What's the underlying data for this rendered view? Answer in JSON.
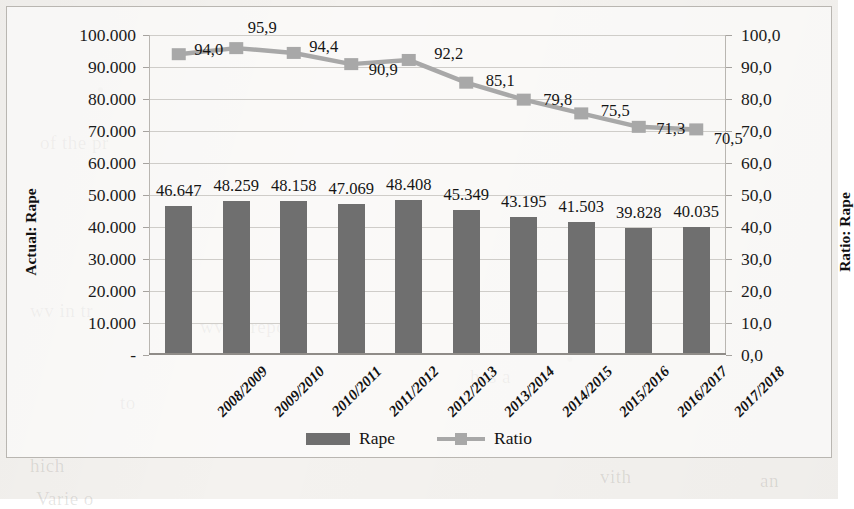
{
  "chart_data": {
    "type": "bar",
    "title": "",
    "categories": [
      "2008/2009",
      "2009/2010",
      "2010/2011",
      "2011/2012",
      "2012/2013",
      "2013/2014",
      "2014/2015",
      "2015/2016",
      "2016/2017",
      "2017/2018"
    ],
    "series": [
      {
        "name": "Rape",
        "type": "bar",
        "axis": "left",
        "values": [
          46647,
          48259,
          48158,
          47069,
          48408,
          45349,
          43195,
          41503,
          39828,
          40035
        ],
        "labels": [
          "46.647",
          "48.259",
          "48.158",
          "47.069",
          "48.408",
          "45.349",
          "43.195",
          "41.503",
          "39.828",
          "40.035"
        ],
        "color": "#6f6f6f"
      },
      {
        "name": "Ratio",
        "type": "line",
        "axis": "right",
        "values": [
          94.0,
          95.9,
          94.4,
          90.9,
          92.2,
          85.1,
          79.8,
          75.5,
          71.3,
          70.5
        ],
        "labels": [
          "94,0",
          "95,9",
          "94,4",
          "90,9",
          "92,2",
          "85,1",
          "79,8",
          "75,5",
          "71,3",
          "70,5"
        ],
        "color": "#a8a8a8"
      }
    ],
    "xlabel": "",
    "left_axis": {
      "title": "Actual: Rape",
      "ticks": [
        "-",
        "10.000",
        "20.000",
        "30.000",
        "40.000",
        "50.000",
        "60.000",
        "70.000",
        "80.000",
        "90.000",
        "100.000"
      ],
      "tick_values": [
        0,
        10000,
        20000,
        30000,
        40000,
        50000,
        60000,
        70000,
        80000,
        90000,
        100000
      ],
      "min": 0,
      "max": 100000
    },
    "right_axis": {
      "title": "Ratio: Rape",
      "ticks": [
        "0,0",
        "10,0",
        "20,0",
        "30,0",
        "40,0",
        "50,0",
        "60,0",
        "70,0",
        "80,0",
        "90,0",
        "100,0"
      ],
      "tick_values": [
        0,
        10,
        20,
        30,
        40,
        50,
        60,
        70,
        80,
        90,
        100
      ],
      "min": 0,
      "max": 100
    },
    "grid": true,
    "legend_position": "bottom",
    "legend": [
      "Rape",
      "Ratio"
    ]
  },
  "ghost_text": [
    {
      "text": "of the pr",
      "x": 40,
      "y": 132
    },
    {
      "text": "wv in tr",
      "x": 30,
      "y": 300
    },
    {
      "text": "wv to repor",
      "x": 200,
      "y": 316
    },
    {
      "text": "has a",
      "x": 470,
      "y": 366
    },
    {
      "text": "to",
      "x": 120,
      "y": 392
    },
    {
      "text": "hich",
      "x": 30,
      "y": 455
    },
    {
      "text": "Varie o",
      "x": 36,
      "y": 488
    },
    {
      "text": "vith",
      "x": 600,
      "y": 466
    },
    {
      "text": "an",
      "x": 760,
      "y": 470
    }
  ]
}
